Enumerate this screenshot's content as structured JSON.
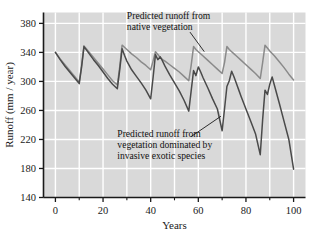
{
  "chart_data": {
    "type": "line",
    "title": "",
    "xlabel": "Years",
    "ylabel": "Runoff (mm / year)",
    "xlim": [
      -5,
      105
    ],
    "ylim": [
      140,
      395
    ],
    "xticks": [
      0,
      20,
      40,
      60,
      80,
      100
    ],
    "xtick_labels": [
      "0",
      "20",
      "40",
      "60",
      "80",
      "100"
    ],
    "xminor_ticks": [
      10,
      30,
      50,
      70,
      90
    ],
    "yticks": [
      140,
      180,
      220,
      260,
      300,
      340,
      380
    ],
    "ytick_labels": [
      "140",
      "180",
      "220",
      "260",
      "300",
      "340",
      "380"
    ],
    "grid": true,
    "legend": "none",
    "plot_bg": "#d9d9d9",
    "grid_color": "#ffffff",
    "series": [
      {
        "name": "Predicted runoff from native vegetation",
        "color": "#8a8a8a",
        "x": [
          0,
          2,
          4,
          6,
          8,
          10,
          11,
          12,
          14,
          16,
          18,
          20,
          22,
          24,
          26,
          27,
          28,
          29,
          30,
          32,
          34,
          36,
          38,
          40,
          41,
          42,
          43,
          44,
          45,
          46,
          48,
          50,
          52,
          54,
          56,
          57,
          58,
          59,
          60,
          62,
          64,
          66,
          68,
          70,
          71,
          72,
          73,
          74,
          75,
          76,
          78,
          80,
          82,
          84,
          86,
          87,
          88,
          89,
          90,
          92,
          94,
          96,
          98,
          100
        ],
        "y": [
          340,
          331,
          323,
          315,
          307,
          299,
          322,
          349,
          341,
          333,
          325,
          317,
          309,
          301,
          295,
          320,
          350,
          347,
          344,
          338,
          333,
          327,
          322,
          316,
          328,
          341,
          337,
          333,
          330,
          328,
          323,
          318,
          313,
          307,
          301,
          322,
          348,
          344,
          341,
          335,
          329,
          323,
          317,
          311,
          326,
          348,
          344,
          341,
          338,
          335,
          329,
          323,
          317,
          311,
          304,
          326,
          350,
          346,
          342,
          335,
          327,
          319,
          310,
          302
        ]
      },
      {
        "name": "Predicted runoff from vegetation dominated by invasive exotic species",
        "color": "#4a4a4a",
        "x": [
          0,
          2,
          4,
          6,
          8,
          10,
          11,
          12,
          14,
          16,
          18,
          20,
          22,
          24,
          26,
          27,
          28,
          29,
          30,
          32,
          34,
          36,
          38,
          40,
          41,
          42,
          43,
          44,
          45,
          46,
          48,
          50,
          52,
          54,
          56,
          57,
          58,
          59,
          60,
          61,
          62,
          64,
          66,
          68,
          70,
          71,
          72,
          73,
          74,
          75,
          76,
          77,
          78,
          80,
          82,
          84,
          86,
          87,
          88,
          89,
          90,
          91,
          92,
          94,
          96,
          98,
          100
        ],
        "y": [
          340,
          330,
          321,
          313,
          305,
          297,
          320,
          348,
          339,
          330,
          322,
          313,
          304,
          296,
          290,
          316,
          345,
          336,
          328,
          316,
          307,
          298,
          288,
          276,
          305,
          337,
          330,
          334,
          328,
          321,
          309,
          298,
          287,
          274,
          259,
          287,
          315,
          308,
          320,
          313,
          305,
          291,
          276,
          262,
          232,
          262,
          293,
          301,
          314,
          306,
          297,
          288,
          279,
          262,
          245,
          228,
          199,
          247,
          288,
          282,
          296,
          306,
          294,
          270,
          245,
          220,
          179
        ]
      }
    ],
    "annotations": [
      {
        "id": "native-label",
        "lines": [
          "Predicted runoff from",
          "native vegetation"
        ],
        "x": 30,
        "y": 386,
        "leader_from": [
          56.5,
          368
        ],
        "leader_to": [
          62.5,
          341
        ]
      },
      {
        "id": "invasive-label",
        "lines": [
          "Predicted runoff from",
          "vegetation dominated by",
          "invasive exotic species"
        ],
        "x": 26,
        "y": 224,
        "leader_from": [
          57,
          224
        ],
        "leader_to": [
          69.5,
          252
        ]
      }
    ]
  }
}
